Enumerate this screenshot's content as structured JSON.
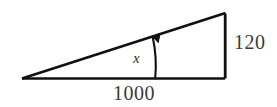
{
  "figure": {
    "type": "right-triangle-diagram",
    "background_color": "#ffffff",
    "stroke_color": "#111111",
    "text_color": "#3a3a3a",
    "angle_label": "x",
    "base_label": "1000",
    "height_label": "120",
    "labels": {
      "base": "1000",
      "height": "120",
      "angle": "x"
    },
    "geometry": {
      "left_vertex": [
        22,
        78
      ],
      "bottom_right_vertex": [
        225,
        78
      ],
      "top_right_vertex": [
        225,
        13
      ],
      "base_length_px": 203,
      "height_length_px": 65,
      "angle_arc_center": [
        22,
        78
      ],
      "angle_arc_radius_px": 133,
      "arrow_direction": "counterclockwise-to-hypotenuse"
    }
  }
}
